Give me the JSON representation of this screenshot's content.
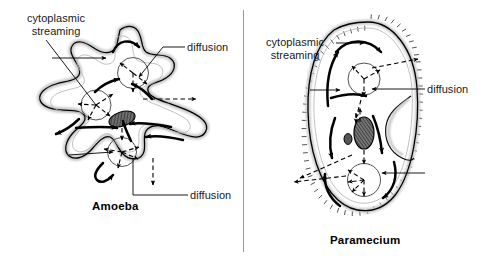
{
  "figure": {
    "background_color": "#ffffff",
    "ink_color": "#000000",
    "divider_color": "#9a9a9a"
  },
  "panels": [
    {
      "id": "amoeba",
      "caption": "Amoeba",
      "labels": {
        "streaming": "cytoplasmic\nstreaming",
        "diffusion_top": "diffusion",
        "diffusion_bottom": "diffusion"
      },
      "structures": [
        "pseudopod",
        "cell-membrane",
        "nucleus",
        "food-vacuole"
      ]
    },
    {
      "id": "paramecium",
      "caption": "Paramecium",
      "labels": {
        "streaming": "cytoplasmic\nstreaming",
        "diffusion": "diffusion"
      },
      "structures": [
        "cilia",
        "oral-groove",
        "cell-membrane",
        "macronucleus",
        "micronucleus",
        "food-vacuole"
      ]
    }
  ],
  "legend_keys": {
    "solid_arrow": "cytoplasmic streaming",
    "dashed_arrow": "diffusion"
  }
}
